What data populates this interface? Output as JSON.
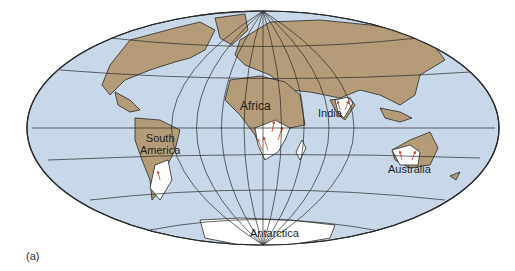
{
  "figure": {
    "type": "world-map",
    "projection": "Mollweide/Hammer-style oval",
    "caption": "(a)",
    "colors": {
      "ocean": "#c9d8e8",
      "land": "#b39c77",
      "ice": "#ffffff",
      "grid": "#2a2a2a",
      "arrows": "#c8553a"
    }
  },
  "labels": {
    "africa": "Africa",
    "india": "India",
    "south_america_line1": "South",
    "south_america_line2": "America",
    "australia": "Australia",
    "antarctica": "Antarctica"
  }
}
